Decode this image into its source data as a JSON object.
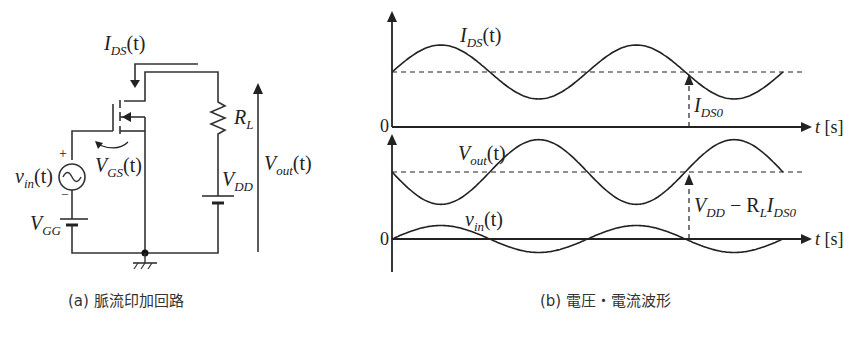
{
  "circuit": {
    "caption": "(a)  脈流印加回路",
    "labels": {
      "ids_main": "I",
      "ids_sub": "DS",
      "ids_arg": "(t)",
      "rl_main": "R",
      "rl_sub": "L",
      "vgs_main": "V",
      "vgs_sub": "GS",
      "vgs_arg": "(t)",
      "vin_main": "v",
      "vin_sub": "in",
      "vin_arg": "(t)",
      "vgg_main": "V",
      "vgg_sub": "GG",
      "vdd_main": "V",
      "vdd_sub": "DD",
      "vout_main": "V",
      "vout_sub": "out",
      "vout_arg": "(t)",
      "plus": "+",
      "minus": "−"
    }
  },
  "waveforms": {
    "caption": "(b)  電圧・電流波形",
    "top": {
      "origin": "0",
      "xlabel_var": "t",
      "xlabel_unit": " [s]",
      "curve_main": "I",
      "curve_sub": "DS",
      "curve_arg": "(t)",
      "offset_main": "I",
      "offset_sub": "DS0"
    },
    "bottom": {
      "origin": "0",
      "xlabel_var": "t",
      "xlabel_unit": " [s]",
      "vout_main": "V",
      "vout_sub": "out",
      "vout_arg": "(t)",
      "vin_main": "v",
      "vin_sub": "in",
      "vin_arg": "(t)",
      "offset_v1": "V",
      "offset_s1": "DD",
      "offset_mid": " − R",
      "offset_s2": "L",
      "offset_v2": "I",
      "offset_s3": "DS0"
    }
  },
  "chart_data": {
    "type": "line",
    "title": "電圧・電流波形",
    "xlabel": "t [s]",
    "periods_shown": 2,
    "series": [
      {
        "name": "I_DS(t)",
        "form": "I_DS0 + a·sin(ωt)",
        "dc_offset_label": "I_DS0",
        "relative_amplitude": 0.5,
        "phase": "in phase with v_in"
      },
      {
        "name": "V_out(t)",
        "form": "V_DD − R_L·I_DS(t)",
        "dc_offset_label": "V_DD − R_L I_DS0",
        "relative_amplitude": 0.6,
        "phase": "inverted relative to v_in"
      },
      {
        "name": "v_in(t)",
        "form": "b·sin(ωt)",
        "dc_offset": 0,
        "relative_amplitude": 0.25
      }
    ]
  }
}
